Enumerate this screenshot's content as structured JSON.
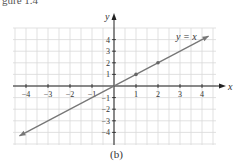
{
  "header_fragment": "gure 1.4",
  "caption": "(b)",
  "chart_data": {
    "type": "line",
    "title": "",
    "annotation": "y = x",
    "xlabel": "x",
    "ylabel": "y",
    "xticks": [
      -4,
      -3,
      -2,
      -1,
      1,
      2,
      3,
      4
    ],
    "yticks": [
      -4,
      -3,
      -2,
      -1,
      1,
      2,
      3,
      4
    ],
    "xlim": [
      -4.5,
      4.5
    ],
    "ylim": [
      -5,
      5
    ],
    "grid": true,
    "series": [
      {
        "name": "y = x",
        "x": [
          -4.3,
          4.3
        ],
        "y": [
          -4.3,
          4.3
        ],
        "color": "#777777"
      }
    ],
    "points": [
      {
        "x": 1,
        "y": 1
      },
      {
        "x": 2,
        "y": 2
      }
    ],
    "legend": null
  },
  "colors": {
    "grid": "#d9d9d9",
    "axis": "#222222",
    "line": "#777777",
    "point": "#666666"
  }
}
